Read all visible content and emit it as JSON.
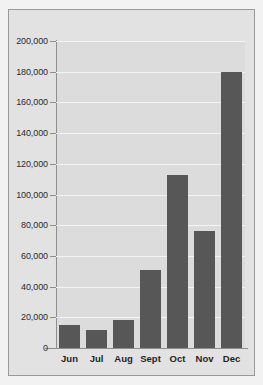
{
  "chart_data": {
    "type": "bar",
    "title": "",
    "subtitle": "",
    "xlabel": "",
    "ylabel": "",
    "categories": [
      "Jun",
      "Jul",
      "Aug",
      "Sept",
      "Oct",
      "Nov",
      "Dec"
    ],
    "values": [
      15000,
      11700,
      18200,
      51000,
      113000,
      76000,
      180000
    ],
    "series": [
      {
        "name": "",
        "values": [
          15000,
          11700,
          18200,
          51000,
          113000,
          76000,
          180000
        ]
      }
    ],
    "ylim": [
      0,
      200000
    ],
    "ytick_values": [
      0,
      20000,
      40000,
      60000,
      80000,
      100000,
      120000,
      140000,
      160000,
      180000,
      200000
    ],
    "ytick_labels": [
      "0",
      "20,000",
      "40,000",
      "60,000",
      "80,000",
      "100,000",
      "120,000",
      "140,000",
      "160,000",
      "180,000",
      "200,000"
    ],
    "grid": true,
    "grid_axis": "y",
    "legend": false,
    "legend_position": "none",
    "colors": {
      "bar": "#575757",
      "plot_background": "#dcdcdc",
      "figure_background": "#e2e2e2",
      "page_background": "#f2f2f2",
      "gridline": "#f4f4f4",
      "axis_line": "#8d8d8d",
      "border": "#9a9a9a",
      "tick_label": "#2b2b2b",
      "category_label": "#1f1f1f"
    }
  }
}
